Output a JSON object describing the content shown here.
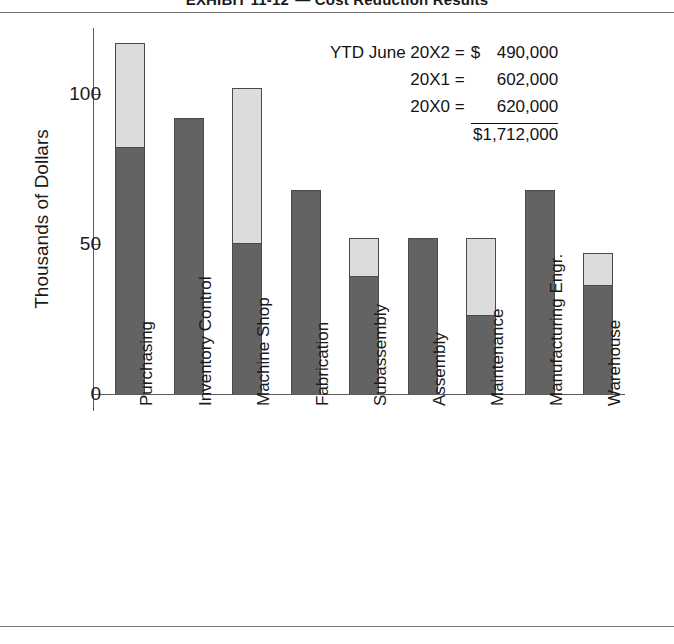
{
  "title": {
    "label": "EXHIBIT 11-12",
    "dash": "—",
    "text": "Cost Reduction Results",
    "full": "EXHIBIT 11-12   Cost Reduction Results"
  },
  "annotation": {
    "rows": [
      {
        "label": "YTD June 20X2 =",
        "currency": "$",
        "amount": "490,000"
      },
      {
        "label": "20X1 =",
        "currency": "",
        "amount": "602,000"
      },
      {
        "label": "20X0 =",
        "currency": "",
        "amount": "620,000"
      }
    ],
    "total": "$1,712,000"
  },
  "chart_data": {
    "type": "bar",
    "stacked": true,
    "xlabel": "",
    "ylabel": "Thousands of Dollars",
    "ylim": [
      0,
      122
    ],
    "yticks": [
      0,
      50,
      100
    ],
    "ytick_labels": [
      "0",
      "50",
      "100"
    ],
    "grid": false,
    "legend": "none",
    "categories": [
      "Purchasing",
      "Inventory Control",
      "Machine Shop",
      "Fabrication",
      "Subassembly",
      "Assembly",
      "Maintenance",
      "Manufacturing Engr.",
      "Warehouse"
    ],
    "series": [
      {
        "name": "Achieved",
        "color": "#636363",
        "values": [
          82,
          92,
          50,
          68,
          39,
          52,
          26,
          68,
          36
        ]
      },
      {
        "name": "Remaining",
        "color": "#dcdcdc",
        "values": [
          35,
          0,
          52,
          0,
          13,
          0,
          26,
          0,
          11
        ]
      }
    ],
    "totals": [
      117,
      92,
      102,
      68,
      52,
      52,
      52,
      68,
      47
    ]
  },
  "colors": {
    "dark_segment": "#636363",
    "light_segment": "#dcdcdc",
    "bar_outline": "#4a4a4a",
    "axis": "#5a5a5a",
    "rule": "#777777",
    "text": "#1a1a1a"
  }
}
